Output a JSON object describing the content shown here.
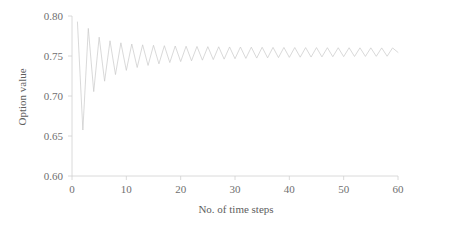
{
  "chart_data": {
    "type": "line",
    "title": "",
    "subtitle": "",
    "xlabel": "No. of time steps",
    "ylabel": "Option value",
    "xlim": [
      0,
      60
    ],
    "ylim": [
      0.6,
      0.8
    ],
    "xticks": [
      0,
      10,
      20,
      30,
      40,
      50,
      60
    ],
    "xtick_labels": [
      "0",
      "10",
      "20",
      "30",
      "40",
      "50",
      "60"
    ],
    "yticks": [
      0.6,
      0.65,
      0.7,
      0.75,
      0.8
    ],
    "ytick_labels": [
      "0.60",
      "0.65",
      "0.70",
      "0.75",
      "0.80"
    ],
    "grid": false,
    "legend": null,
    "legend_position": "none",
    "line_color": "#c9c9c9",
    "axis_color": "#d0d0d0",
    "text_color": "#6f6f6f",
    "background": "#ffffff",
    "converged_value": 0.7545,
    "series": [
      {
        "name": "Option value",
        "x": [
          1,
          2,
          3,
          4,
          5,
          6,
          7,
          8,
          9,
          10,
          11,
          12,
          13,
          14,
          15,
          16,
          17,
          18,
          19,
          20,
          21,
          22,
          23,
          24,
          25,
          26,
          27,
          28,
          29,
          30,
          31,
          32,
          33,
          34,
          35,
          36,
          37,
          38,
          39,
          40,
          41,
          42,
          43,
          44,
          45,
          46,
          47,
          48,
          49,
          50,
          51,
          52,
          53,
          54,
          55,
          56,
          57,
          58,
          59,
          60
        ],
        "values": [
          0.7925,
          0.6575,
          0.7845,
          0.7055,
          0.7735,
          0.7185,
          0.769,
          0.7268,
          0.7665,
          0.732,
          0.765,
          0.7356,
          0.764,
          0.7382,
          0.7634,
          0.7402,
          0.7629,
          0.7418,
          0.7625,
          0.743,
          0.7622,
          0.744,
          0.7619,
          0.7448,
          0.7617,
          0.7455,
          0.7615,
          0.7461,
          0.7613,
          0.7466,
          0.7612,
          0.747,
          0.761,
          0.7474,
          0.7609,
          0.7477,
          0.7608,
          0.748,
          0.7607,
          0.7483,
          0.7606,
          0.7485,
          0.7605,
          0.7487,
          0.7605,
          0.7489,
          0.7604,
          0.7491,
          0.7603,
          0.7492,
          0.7603,
          0.7494,
          0.7602,
          0.7495,
          0.7602,
          0.7496,
          0.7601,
          0.7497,
          0.7601,
          0.7545
        ]
      }
    ]
  }
}
